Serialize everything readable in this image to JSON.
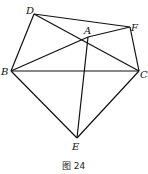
{
  "figure": {
    "caption": "图 24",
    "points": {
      "D": {
        "label": "D",
        "x": 34,
        "y": 14
      },
      "F": {
        "label": "F",
        "x": 130,
        "y": 27
      },
      "A": {
        "label": "A",
        "x": 88,
        "y": 37
      },
      "B": {
        "label": "B",
        "x": 11,
        "y": 71
      },
      "C": {
        "label": "C",
        "x": 139,
        "y": 71
      },
      "E": {
        "label": "E",
        "x": 77,
        "y": 138
      }
    },
    "segments": [
      [
        "D",
        "F"
      ],
      [
        "D",
        "C"
      ],
      [
        "D",
        "B"
      ],
      [
        "B",
        "A"
      ],
      [
        "A",
        "F"
      ],
      [
        "F",
        "C"
      ],
      [
        "B",
        "C"
      ],
      [
        "A",
        "E"
      ],
      [
        "B",
        "E"
      ],
      [
        "E",
        "C"
      ]
    ]
  }
}
